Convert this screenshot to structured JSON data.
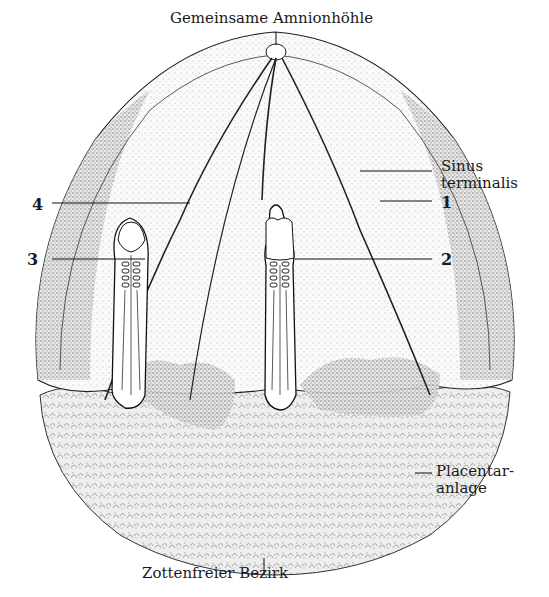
{
  "figure": {
    "type": "anatomical-illustration",
    "labels": {
      "top": "Gemeinsame Amnionhöhle",
      "sinus_line1": "Sinus",
      "sinus_line2": "terminalis",
      "num1": "1",
      "num2": "2",
      "num3": "3",
      "num4": "4",
      "placentar_line1": "Placentar-",
      "placentar_line2": "anlage",
      "bottom": "Zottenfreier Bezirk"
    },
    "colors": {
      "ink": "#1a1a1a",
      "background": "#ffffff",
      "stipple_light": "#d8d8d8",
      "stipple_dark": "#8a8a8a"
    }
  }
}
